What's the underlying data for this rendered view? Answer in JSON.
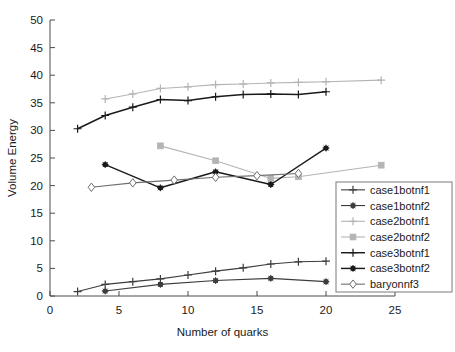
{
  "chart_data": {
    "type": "line",
    "title": "",
    "xlabel": "Number of quarks",
    "ylabel": "Volume Energy",
    "xlim": [
      0,
      25
    ],
    "ylim": [
      0,
      50
    ],
    "xticks": [
      0,
      5,
      10,
      15,
      20,
      25
    ],
    "yticks": [
      0,
      5,
      10,
      15,
      20,
      25,
      30,
      35,
      40,
      45,
      50
    ],
    "xtick_labels": [
      "0",
      "5",
      "10",
      "15",
      "20",
      "25"
    ],
    "ytick_labels": [
      "0",
      "5",
      "10",
      "15",
      "20",
      "25",
      "30",
      "35",
      "40",
      "45",
      "50"
    ],
    "grid": false,
    "legend_position": "lower right",
    "series": [
      {
        "name": "case1botnf1",
        "color": "#3d3d3d",
        "marker": "plus",
        "x": [
          2,
          4,
          6,
          8,
          10,
          12,
          14,
          16,
          18,
          20
        ],
        "values": [
          0.8,
          2.1,
          2.6,
          3.1,
          3.8,
          4.5,
          5.1,
          5.8,
          6.2,
          6.3
        ]
      },
      {
        "name": "case1botnf2",
        "color": "#3d3d3d",
        "marker": "star",
        "x": [
          4,
          8,
          12,
          16,
          20
        ],
        "values": [
          0.9,
          2.1,
          2.8,
          3.2,
          2.6
        ]
      },
      {
        "name": "case2botnf1",
        "color": "#b4b4b4",
        "marker": "plus",
        "x": [
          4,
          6,
          8,
          10,
          12,
          14,
          16,
          18,
          20,
          24
        ],
        "values": [
          35.7,
          36.6,
          37.6,
          37.9,
          38.3,
          38.4,
          38.6,
          38.7,
          38.8,
          39.1
        ]
      },
      {
        "name": "case2botnf2",
        "color": "#b4b4b4",
        "marker": "square",
        "x": [
          8,
          12,
          16,
          18,
          24
        ],
        "values": [
          27.2,
          24.5,
          21.3,
          21.6,
          23.7
        ]
      },
      {
        "name": "case3botnf1",
        "color": "#1a1a1a",
        "marker": "plus",
        "x": [
          2,
          4,
          6,
          8,
          10,
          12,
          14,
          16,
          18,
          20
        ],
        "values": [
          30.3,
          32.7,
          34.2,
          35.6,
          35.4,
          36.1,
          36.5,
          36.6,
          36.5,
          37.0
        ]
      },
      {
        "name": "case3botnf2",
        "color": "#1a1a1a",
        "marker": "star",
        "x": [
          4,
          8,
          12,
          16,
          20
        ],
        "values": [
          23.8,
          19.6,
          22.5,
          20.2,
          26.8
        ]
      },
      {
        "name": "baryonnf3",
        "color": "#6e6e6e",
        "marker": "diamond",
        "x": [
          3,
          6,
          9,
          12,
          15,
          18
        ],
        "values": [
          19.7,
          20.5,
          21.0,
          21.5,
          21.8,
          22.2
        ]
      }
    ]
  },
  "legend": {
    "entries": [
      {
        "label": "case1botnf1"
      },
      {
        "label": "case1botnf2"
      },
      {
        "label": "case2botnf1"
      },
      {
        "label": "case2botnf2"
      },
      {
        "label": "case3botnf1"
      },
      {
        "label": "case3botnf2"
      },
      {
        "label": "baryonnf3"
      }
    ]
  },
  "colors": {
    "axis": "#4d4d4d",
    "text": "#1a1a1a",
    "background": "#ffffff",
    "legend_border": "#7a7a7a"
  }
}
